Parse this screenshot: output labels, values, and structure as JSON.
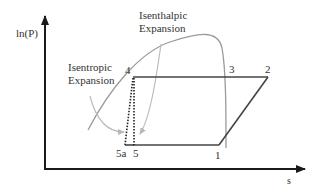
{
  "diagram": {
    "type": "ln(P)-s refrigeration cycle",
    "axes": {
      "y_label": "ln(P)",
      "x_label": "s"
    },
    "annotations": {
      "isenthalpic": [
        "Isenthalpic",
        "Expansion"
      ],
      "isentropic": [
        "Isentropic",
        "Expansion"
      ]
    },
    "points": [
      {
        "id": "1",
        "label": "1"
      },
      {
        "id": "2",
        "label": "2"
      },
      {
        "id": "3",
        "label": "3"
      },
      {
        "id": "4",
        "label": "4"
      },
      {
        "id": "5",
        "label": "5"
      },
      {
        "id": "5a",
        "label": "5a"
      }
    ],
    "colors": {
      "axis": "#1a1a1a",
      "cycle": "#444444",
      "dome": "#9a9a9a",
      "arrow": "#b0b0b0"
    }
  }
}
